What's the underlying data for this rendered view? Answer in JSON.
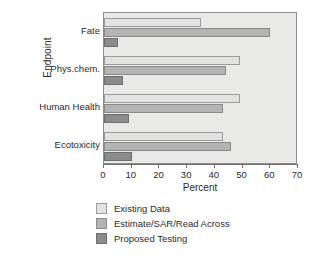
{
  "chart_data": {
    "type": "bar",
    "orientation": "horizontal",
    "title": "",
    "xlabel": "Percent",
    "ylabel": "Endpoint",
    "categories": [
      "Fate",
      "Phys.chem.",
      "Human Health",
      "Ecotoxicity"
    ],
    "series": [
      {
        "name": "Existing Data",
        "color": "#e2e2e0",
        "values": [
          35,
          49,
          49,
          43
        ]
      },
      {
        "name": "Estimate/SAR/Read Across",
        "color": "#b4b4b4",
        "values": [
          60,
          44,
          43,
          46
        ]
      },
      {
        "name": "Proposed Testing",
        "color": "#8b8b8b",
        "values": [
          5,
          7,
          9,
          10
        ]
      }
    ],
    "xlim": [
      0,
      70
    ],
    "xticks": [
      0,
      10,
      20,
      30,
      40,
      50,
      60,
      70
    ],
    "xtick_labels": [
      "0",
      "10",
      "20",
      "30",
      "40",
      "50",
      "60",
      "70"
    ],
    "grid": false,
    "legend_position": "below",
    "plot_background": "#e9e9e7",
    "frame_color": "#8d8d8d"
  },
  "axes": {
    "x_title": "Percent",
    "y_title": "Endpoint"
  },
  "legend": {
    "items": [
      {
        "label": "Existing Data"
      },
      {
        "label": "Estimate/SAR/Read Across"
      },
      {
        "label": "Proposed Testing"
      }
    ]
  }
}
